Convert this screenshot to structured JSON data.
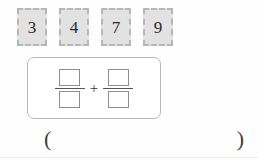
{
  "worksheet": {
    "background_color": "#fefefe",
    "tiles": {
      "name": "number-tiles",
      "items": [
        {
          "value": "3"
        },
        {
          "value": "4"
        },
        {
          "value": "7"
        },
        {
          "value": "9"
        }
      ],
      "fill_color": "#e2e2e2",
      "border_color": "#b6b6b6",
      "border_style": "dashed"
    },
    "expression": {
      "type": "fraction-addition",
      "operator": "+",
      "left_fraction": {
        "numerator": "",
        "denominator": ""
      },
      "right_fraction": {
        "numerator": "",
        "denominator": ""
      },
      "panel_border_color": "#b9b9b9",
      "slot_border_color": "#8d8d8d"
    },
    "answer": {
      "open_paren": "(",
      "close_paren": ")",
      "value": ""
    }
  }
}
